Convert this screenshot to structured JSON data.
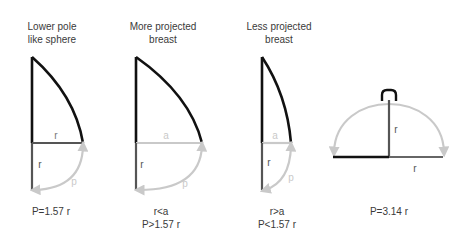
{
  "panels": [
    {
      "id": "lower-pole-sphere",
      "title_line1": "Lower pole",
      "title_line2": "like sphere",
      "horizontal_label": "r",
      "vertical_label": "r",
      "arc_label": "p",
      "formula_line1": "P=1.57 r",
      "formula_line2": ""
    },
    {
      "id": "more-projected",
      "title_line1": "More projected",
      "title_line2": "breast",
      "horizontal_label": "a",
      "vertical_label": "r",
      "arc_label": "p",
      "formula_line1": "r<a",
      "formula_line2": "P>1.57 r"
    },
    {
      "id": "less-projected",
      "title_line1": "Less projected",
      "title_line2": "breast",
      "horizontal_label": "a",
      "vertical_label": "r",
      "arc_label": "p",
      "formula_line1": "r>a",
      "formula_line2": "P<1.57 r"
    },
    {
      "id": "full-sphere",
      "title_line1": "",
      "title_line2": "",
      "vertical_label": "r",
      "horizontal_label": "r",
      "formula_line1": "P=3.14 r",
      "formula_line2": ""
    }
  ],
  "colors": {
    "outline": "#111111",
    "radius": "#555555",
    "light": "#c9c9c9",
    "text": "#3a3a3a"
  }
}
